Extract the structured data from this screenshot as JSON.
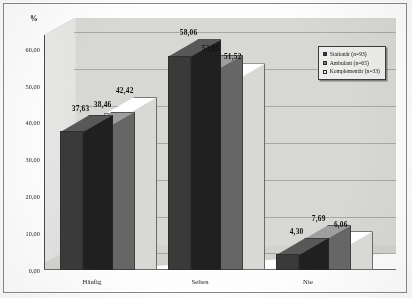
{
  "chart_data": {
    "type": "bar",
    "title": "",
    "subtitle": "",
    "xlabel": "",
    "ylabel": "%",
    "categories": [
      "Häufig",
      "Selten",
      "Nie"
    ],
    "series": [
      {
        "name": "Stationär (n=93)",
        "values": [
          37.63,
          58.06,
          4.3
        ],
        "color": "#3a3a3a"
      },
      {
        "name": "Ambulant (n=65)",
        "values": [
          38.46,
          53.85,
          7.69
        ],
        "color": "#808080"
      },
      {
        "name": "Komplementär (n=33)",
        "values": [
          42.42,
          51.52,
          6.06
        ],
        "color": "#f2f2ee"
      }
    ],
    "value_labels": [
      [
        "37,63",
        "38,46",
        "42,42"
      ],
      [
        "58,06",
        "53,85",
        "51,52"
      ],
      [
        "4,30",
        "7,69",
        "6,06"
      ]
    ],
    "ylim": [
      0,
      60
    ],
    "ytick_values": [
      0,
      10,
      20,
      30,
      40,
      50,
      60
    ],
    "ytick_labels": [
      "0,00",
      "10,00",
      "20,00",
      "30,00",
      "40,00",
      "50,00",
      "60,00"
    ],
    "grid": true,
    "legend_position": "upper-right-inside",
    "three_d": true
  },
  "axis": {
    "unit_label": "%"
  },
  "legend": {
    "entries": [
      {
        "label": "Stationär (n=93)",
        "swatch": "#3a3a3a"
      },
      {
        "label": "Ambulant (n=65)",
        "swatch": "#808080"
      },
      {
        "label": "Komplementär (n=33)",
        "swatch": "#f2f2ee"
      }
    ]
  },
  "colors": {
    "series_1": "#3a3a3a",
    "series_2": "#808080",
    "series_3": "#f2f2ee",
    "plot_background": "#d9d9d6",
    "frame_border": "#8a8a8a"
  }
}
